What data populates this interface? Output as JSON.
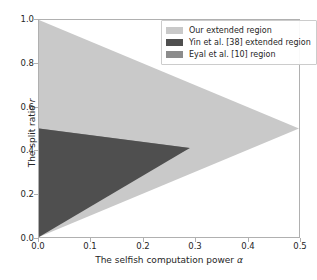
{
  "chart_data": {
    "type": "area",
    "title": "",
    "xlabel": "The selfish computation power α",
    "ylabel": "The split ratio r",
    "xlim": [
      0.0,
      0.5
    ],
    "ylim": [
      0.0,
      1.0
    ],
    "xticks": [
      "0.0",
      "0.1",
      "0.2",
      "0.3",
      "0.4",
      "0.5"
    ],
    "xtick_values": [
      0.0,
      0.1,
      0.2,
      0.3,
      0.4,
      0.5
    ],
    "yticks": [
      "0.0",
      "0.2",
      "0.4",
      "0.6",
      "0.8",
      "1.0"
    ],
    "ytick_values": [
      0.0,
      0.2,
      0.4,
      0.6,
      0.8,
      1.0
    ],
    "grid": false,
    "legend_position": "upper right",
    "series": [
      {
        "name": "Our extended region",
        "color": "#c9c9c9",
        "shape": "triangle",
        "polygon": [
          [
            0.0,
            0.0
          ],
          [
            0.0,
            1.0
          ],
          [
            0.5,
            0.5
          ]
        ],
        "apex": [
          0.5,
          0.5
        ],
        "left_edge_range": [
          0.0,
          1.0
        ]
      },
      {
        "name": "Yin et al. [38] extended region",
        "color": "#4f4f4f",
        "shape": "triangle",
        "polygon": [
          [
            0.0,
            0.0
          ],
          [
            0.0,
            0.5
          ],
          [
            0.29,
            0.41
          ]
        ],
        "apex": [
          0.29,
          0.41
        ],
        "left_edge_range": [
          0.0,
          0.5
        ]
      },
      {
        "name": "Eyal et al. [10] region",
        "color": "#8c8c8c",
        "shape": "triangle",
        "polygon": [
          [
            0.0,
            0.06
          ],
          [
            0.0,
            0.5
          ],
          [
            0.29,
            0.41
          ]
        ],
        "apex": [
          0.29,
          0.41
        ],
        "left_edge_range": [
          0.06,
          0.5
        ]
      }
    ]
  },
  "legend": {
    "items": [
      {
        "label": "Our extended region",
        "color": "#c9c9c9"
      },
      {
        "label": "Yin et al. [38] extended region",
        "color": "#4f4f4f"
      },
      {
        "label": "Eyal et al. [10] region",
        "color": "#8c8c8c"
      }
    ]
  },
  "axes": {
    "xlabel": "The selfish computation power α",
    "ylabel": "The split ratio r",
    "xticks": [
      "0.0",
      "0.1",
      "0.2",
      "0.3",
      "0.4",
      "0.5"
    ],
    "yticks": [
      "0.0",
      "0.2",
      "0.4",
      "0.6",
      "0.8",
      "1.0"
    ]
  },
  "colors": {
    "background": "#ffffff",
    "axis": "#b0b0b0",
    "text": "#262626"
  }
}
